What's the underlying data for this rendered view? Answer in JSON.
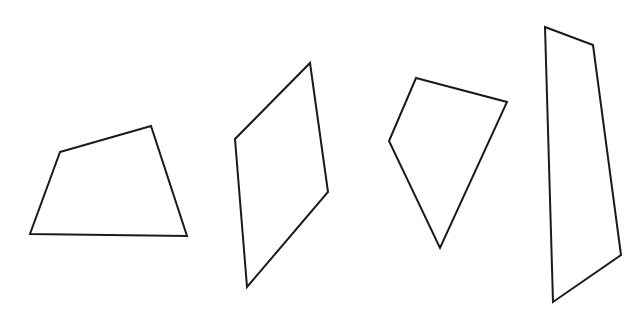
{
  "canvas": {
    "width": 641,
    "height": 329,
    "background": "#ffffff"
  },
  "style": {
    "stroke": "#1a1a1a",
    "stroke_width": 2,
    "fill": "none"
  },
  "shapes": [
    {
      "name": "quadrilateral-1",
      "type": "quadrilateral",
      "points": "60,152 151,126 187,236 30,234"
    },
    {
      "name": "quadrilateral-2",
      "type": "parallelogram",
      "points": "310,63 328,192 247,287 235,139"
    },
    {
      "name": "quadrilateral-3",
      "type": "kite-like quadrilateral",
      "points": "416,78 507,102 440,248 389,141"
    },
    {
      "name": "quadrilateral-4",
      "type": "quadrilateral",
      "points": "545,27 593,45 621,255 553,302"
    }
  ]
}
